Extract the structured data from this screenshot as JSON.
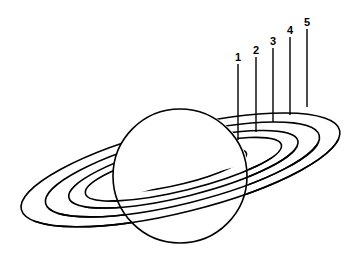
{
  "diagram": {
    "labels": [
      {
        "text": "1",
        "x": 238,
        "y": 61,
        "line_top": 64,
        "line_bottom": 140
      },
      {
        "text": "2",
        "x": 256,
        "y": 54,
        "line_top": 57,
        "line_bottom": 132
      },
      {
        "text": "3",
        "x": 273,
        "y": 45,
        "line_top": 48,
        "line_bottom": 122
      },
      {
        "text": "4",
        "x": 290,
        "y": 34,
        "line_top": 37,
        "line_bottom": 115
      },
      {
        "text": "5",
        "x": 307,
        "y": 26,
        "line_top": 29,
        "line_bottom": 107
      }
    ],
    "colors": {
      "stroke": "#000000",
      "background": "#ffffff"
    }
  }
}
